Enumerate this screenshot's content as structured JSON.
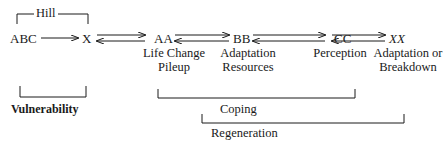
{
  "diagram": {
    "nodes": [
      {
        "id": "abc",
        "label": "ABC"
      },
      {
        "id": "x",
        "label": "X"
      },
      {
        "id": "aa",
        "label": "AA"
      },
      {
        "id": "bb",
        "label": "BB"
      },
      {
        "id": "cc",
        "label": "CC"
      },
      {
        "id": "xx",
        "label": "XX"
      }
    ],
    "node_captions": {
      "aa": [
        "Life Change",
        "Pileup"
      ],
      "bb": [
        "Adaptation",
        "Resources"
      ],
      "cc": [
        "Perception"
      ],
      "xx": [
        "Adaptation or",
        "Breakdown"
      ]
    },
    "edges": [
      {
        "from": "ABC",
        "to": "X",
        "type": "one-way"
      },
      {
        "from": "X",
        "to": "AA",
        "type": "two-way"
      },
      {
        "from": "AA",
        "to": "BB",
        "type": "two-way"
      },
      {
        "from": "BB",
        "to": "CC",
        "type": "two-way"
      },
      {
        "from": "CC",
        "to": "XX",
        "type": "two-way"
      }
    ],
    "brackets": {
      "hill": {
        "label": "Hill",
        "spans": [
          "ABC",
          "X"
        ]
      },
      "vulnerability": {
        "label": "Vulnerability",
        "spans": [
          "ABC"
        ]
      },
      "coping": {
        "label": "Coping",
        "spans": [
          "AA",
          "CC"
        ]
      },
      "regeneration": {
        "label": "Regeneration",
        "spans": [
          "BB",
          "XX"
        ]
      }
    }
  }
}
